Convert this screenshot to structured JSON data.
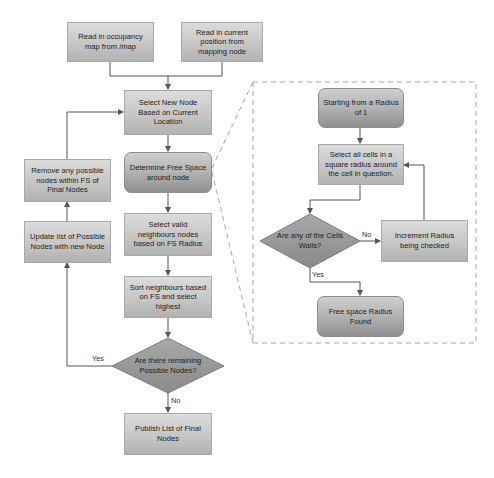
{
  "diagram": {
    "type": "flowchart",
    "main_flow": {
      "nodes": {
        "read_map": "Read in occupancy map from /map",
        "read_position": "Read in current position from mapping node",
        "select_new_node": "Select New Node Based on Current Location",
        "determine_free_space": "Determine Free Space around node",
        "select_valid": "Select valid neighbours nodes based on FS Radius",
        "sort_neighbours": "Sort neighbours based on FS and select highest",
        "remaining_decision": "Are there remaining Possible Nodes?",
        "publish": "Publish List of Final Nodes",
        "update_list": "Update list of Possible Nodes with new Node",
        "remove_nodes": "Remove any possible nodes within FS of Final Nodes"
      },
      "edge_labels": {
        "yes": "Yes",
        "no": "No"
      }
    },
    "detail_flow": {
      "nodes": {
        "start_radius": "Starting from a Radius of 1",
        "select_cells": "Select all cells in a square radius around the cell in question.",
        "walls_decision": "Are any of the Cells Walls?",
        "increment_radius": "Increment Radius being checked",
        "radius_found": "Free space Radius Found"
      },
      "edge_labels": {
        "no": "No",
        "yes": "Yes"
      }
    },
    "colors": {
      "line": "#555555",
      "dashed_border": "#a0a0a0",
      "rect_fill": "#c6c6c6",
      "rounded_fill": "#b2b2b2",
      "diamond_fill": "#9a9a9a"
    }
  }
}
